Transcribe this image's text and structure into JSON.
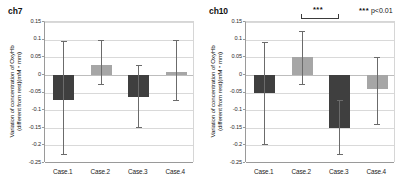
{
  "figure": {
    "panels": [
      "ch7",
      "ch10"
    ]
  },
  "significance": {
    "stars": "***",
    "legend_stars": "***",
    "legend_text": "p<0.01",
    "bracket_from": "Case.2",
    "bracket_to": "Case.3"
  },
  "axis": {
    "ylabel_line1": "Variation of concentration of OxyHb",
    "ylabel_line2": "(different from rest)(mM・mm)",
    "yticks": [
      "0.15",
      "0.1",
      "0.05",
      "0",
      "-0.05",
      "-0.1",
      "-0.15",
      "-0.2",
      "-0.25"
    ],
    "categories": [
      "Case.1",
      "Case.2",
      "Case.3",
      "Case.4"
    ]
  },
  "colors": {
    "bar_dark": "#3f3f3f",
    "bar_light": "#a6a6a6",
    "whisker": "#6b6b6b",
    "grid": "#d9d9d9",
    "axis": "#9a9a9a"
  },
  "chart_data": [
    {
      "type": "bar",
      "title": "ch7",
      "xlabel": "",
      "ylabel": "Variation of concentration of OxyHb (different from rest)(mM・mm)",
      "ylim": [
        -0.25,
        0.15
      ],
      "ytick_step": 0.05,
      "grid": true,
      "legend": "none",
      "categories": [
        "Case.1",
        "Case.2",
        "Case.3",
        "Case.4"
      ],
      "values": [
        -0.07,
        0.027,
        -0.062,
        0.007
      ],
      "error_low": [
        -0.225,
        -0.025,
        -0.148,
        -0.072
      ],
      "error_high": [
        0.095,
        0.098,
        0.028,
        0.1
      ],
      "bar_shades": [
        "dark",
        "light",
        "dark",
        "light"
      ],
      "annotations": []
    },
    {
      "type": "bar",
      "title": "ch10",
      "xlabel": "",
      "ylabel": "Variation of concentration of OxyHb (different from rest)(mM・mm)",
      "ylim": [
        -0.25,
        0.15
      ],
      "ytick_step": 0.05,
      "grid": true,
      "legend": "none",
      "categories": [
        "Case.1",
        "Case.2",
        "Case.3",
        "Case.4"
      ],
      "values": [
        -0.05,
        0.052,
        -0.15,
        -0.04
      ],
      "error_low": [
        -0.197,
        -0.025,
        -0.225,
        -0.14
      ],
      "error_high": [
        0.093,
        0.125,
        -0.072,
        0.052
      ],
      "bar_shades": [
        "dark",
        "light",
        "dark",
        "light"
      ],
      "annotations": [
        {
          "text": "***",
          "between": [
            "Case.2",
            "Case.3"
          ],
          "meaning": "p<0.01"
        }
      ]
    }
  ]
}
